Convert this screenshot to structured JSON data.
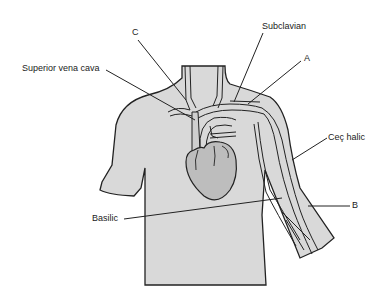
{
  "diagram": {
    "colors": {
      "body_fill": "#d9d9d9",
      "outline": "#222222",
      "vessel_fill": "#cfcfcf",
      "heart_fill": "#bdbdbd"
    },
    "labels": {
      "c": "C",
      "superior_vena_cava": "Superior vena cava",
      "subclavian": "Subclavian",
      "a": "A",
      "cephalic": "Ceç halic",
      "basilic": "Basilic",
      "b": "B"
    }
  }
}
